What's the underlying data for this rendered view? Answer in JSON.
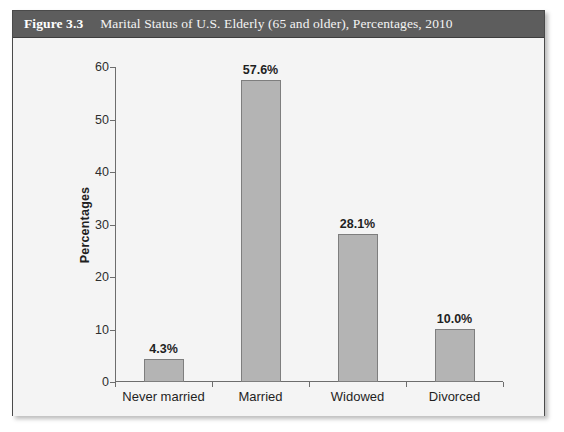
{
  "figure": {
    "number": "Figure 3.3",
    "title": "Marital Status of U.S. Elderly (65 and older), Percentages, 2010",
    "header_bg": "#5d5d5d",
    "panel_bg": "#f4f4f4"
  },
  "chart_data": {
    "type": "bar",
    "title": "Marital Status of U.S. Elderly (65 and older), Percentages, 2010",
    "categories": [
      "Never married",
      "Married",
      "Widowed",
      "Divorced"
    ],
    "values": [
      4.3,
      57.6,
      28.1,
      10.0
    ],
    "value_labels": [
      "4.3%",
      "57.6%",
      "28.1%",
      "10.0%"
    ],
    "xlabel": "",
    "ylabel": "Percentages",
    "ylim": [
      0,
      60
    ],
    "yticks": [
      0,
      10,
      20,
      30,
      40,
      50,
      60
    ],
    "ytick_labels": [
      "0",
      "10",
      "20",
      "30",
      "40",
      "50",
      "60"
    ],
    "grid": false,
    "legend": false,
    "bar_color": "#b4b4b4",
    "bar_edge_color": "#7e7e7e",
    "axis_color": "#6d6d6d"
  }
}
